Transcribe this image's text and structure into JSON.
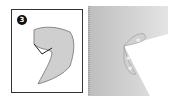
{
  "step": {
    "number": "3"
  },
  "left_panel": {
    "shape": "cutout-shape",
    "fill": "#cfcfcf",
    "stroke": "#888888"
  },
  "right_panel": {
    "background": "#c8c8c8",
    "flap_fill": "#ffffff"
  },
  "colors": {
    "border": "#333333",
    "badge": "#111111"
  }
}
